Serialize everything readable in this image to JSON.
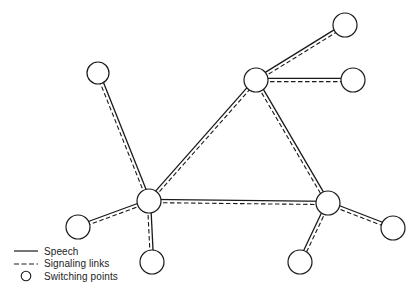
{
  "diagram": {
    "title": "",
    "colors": {
      "line": "#1a1a1a",
      "node_fill": "#ffffff",
      "background": "#ffffff"
    },
    "node_radius": 12,
    "nodes": [
      {
        "id": "n_top_left",
        "x": 98,
        "y": 73,
        "r": 11
      },
      {
        "id": "hub_left",
        "x": 149,
        "y": 201,
        "r": 12
      },
      {
        "id": "hub_top",
        "x": 256,
        "y": 80,
        "r": 12
      },
      {
        "id": "hub_right",
        "x": 328,
        "y": 203,
        "r": 12
      },
      {
        "id": "n_top_right",
        "x": 345,
        "y": 25,
        "r": 12
      },
      {
        "id": "n_right",
        "x": 353,
        "y": 80,
        "r": 12
      },
      {
        "id": "n_left",
        "x": 78,
        "y": 227,
        "r": 12
      },
      {
        "id": "n_bottom_left",
        "x": 152,
        "y": 262,
        "r": 12
      },
      {
        "id": "n_bottom_right",
        "x": 300,
        "y": 262,
        "r": 12
      },
      {
        "id": "n_far_right",
        "x": 393,
        "y": 228,
        "r": 12
      }
    ],
    "links": [
      {
        "from": "n_top_left",
        "to": "hub_left"
      },
      {
        "from": "hub_left",
        "to": "hub_top"
      },
      {
        "from": "hub_left",
        "to": "hub_right"
      },
      {
        "from": "hub_top",
        "to": "hub_right"
      },
      {
        "from": "hub_top",
        "to": "n_top_right"
      },
      {
        "from": "hub_top",
        "to": "n_right"
      },
      {
        "from": "hub_left",
        "to": "n_left"
      },
      {
        "from": "hub_left",
        "to": "n_bottom_left"
      },
      {
        "from": "hub_right",
        "to": "n_bottom_right"
      },
      {
        "from": "hub_right",
        "to": "n_far_right"
      }
    ]
  },
  "legend": {
    "items": [
      {
        "symbol": "solid-line",
        "label": "Speech"
      },
      {
        "symbol": "dashed-line",
        "label": "Signaling links"
      },
      {
        "symbol": "circle",
        "label": "Switching points"
      }
    ]
  }
}
